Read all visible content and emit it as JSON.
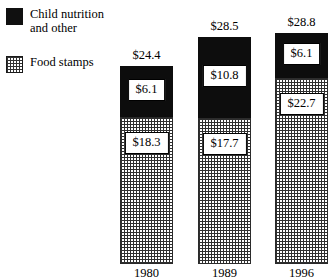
{
  "legend": {
    "items": [
      {
        "label": "Child nutrition\nand other",
        "swatch": "solid-black-square-icon",
        "color": "#0d0d0d"
      },
      {
        "label": "Food stamps",
        "swatch": "dotted-square-icon",
        "color": "#ffffff"
      }
    ]
  },
  "chart_data": {
    "type": "bar",
    "stacked": true,
    "title": "",
    "subtitle": "",
    "xlabel": "",
    "ylabel": "",
    "grid": false,
    "legend_position": "top-left",
    "categories": [
      "1980",
      "1989",
      "1996"
    ],
    "ylim": [
      0,
      28.8
    ],
    "series": [
      {
        "name": "Food stamps",
        "values": [
          18.3,
          17.7,
          22.7
        ],
        "labels": [
          "$18.3",
          "$17.7",
          "$22.7"
        ],
        "color": "#ffffff",
        "pattern": "dotted"
      },
      {
        "name": "Child nutrition and other",
        "values": [
          6.1,
          10.8,
          6.1
        ],
        "labels": [
          "$6.1",
          "$10.8",
          "$6.1"
        ],
        "color": "#0d0d0d",
        "pattern": "solid"
      }
    ],
    "totals": [
      24.4,
      28.5,
      28.8
    ],
    "total_labels": [
      "$24.4",
      "$28.5",
      "$28.8"
    ],
    "annotations": []
  },
  "bars": [
    {
      "year": "1980",
      "total_label": "$24.4",
      "top_label": "$6.1",
      "bottom_label": "$18.3",
      "left": 120,
      "width": 53,
      "top_y": 66,
      "split_y": 117,
      "base_y": 264
    },
    {
      "year": "1989",
      "total_label": "$28.5",
      "top_label": "$10.8",
      "bottom_label": "$17.7",
      "left": 198,
      "width": 53,
      "top_y": 37,
      "split_y": 118,
      "base_y": 264
    },
    {
      "year": "1996",
      "total_label": "$28.8",
      "top_label": "$6.1",
      "bottom_label": "$22.7",
      "left": 275,
      "width": 53,
      "top_y": 33,
      "split_y": 78,
      "base_y": 264
    }
  ]
}
